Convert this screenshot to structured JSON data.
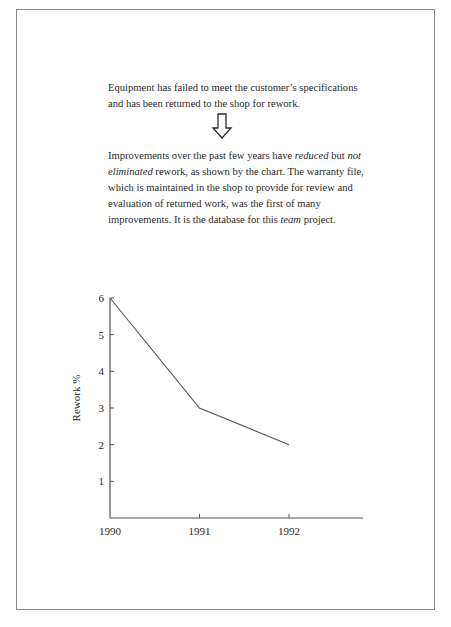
{
  "text": {
    "para1": "Equipment has failed to meet the customer’s specifications and has been returned to the shop for rework.",
    "para2_parts": [
      {
        "text": "Improvements over the past few years have ",
        "italic": false
      },
      {
        "text": "reduced",
        "italic": true
      },
      {
        "text": " but ",
        "italic": false
      },
      {
        "text": "not eliminated",
        "italic": true
      },
      {
        "text": " rework, as shown by the chart. The warranty file, which is maintained in the shop to provide for review and evaluation of returned work, was the first of many improvements. It is the database for this ",
        "italic": false
      },
      {
        "text": "team",
        "italic": true
      },
      {
        "text": " project.",
        "italic": false
      }
    ],
    "arrow_icon": "hollow-down-arrow"
  },
  "chart_data": {
    "type": "line",
    "title": "",
    "xlabel": "",
    "ylabel": "Rework %",
    "x": [
      "1990",
      "1991",
      "1992"
    ],
    "series": [
      {
        "name": "Rework %",
        "values": [
          6,
          3,
          2
        ]
      }
    ],
    "yticks": [
      1,
      2,
      3,
      4,
      5,
      6
    ],
    "xticks": [
      "1990",
      "1991",
      "1992"
    ],
    "ylim": [
      0,
      6
    ],
    "grid": false,
    "legend": "none"
  }
}
